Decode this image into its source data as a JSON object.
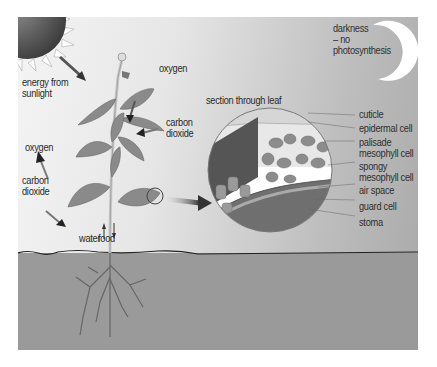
{
  "diagram": {
    "labels": {
      "energy": "energy from\nsunlight",
      "oxygen_top": "oxygen",
      "oxygen_left": "oxygen",
      "co2_left": "carbon\ndioxide",
      "co2_right": "carbon\ndioxide",
      "water": "water",
      "food": "food",
      "section": "section through leaf",
      "darkness": "darkness\n– no\nphotosynthesis"
    },
    "leaf_section_labels": [
      "cuticle",
      "epidermal cell",
      "palisade\nmesophyll cell",
      "spongy\nmesophyll cell",
      "air space",
      "guard cell",
      "stoma"
    ],
    "icons": [
      "sun-icon",
      "moon-icon",
      "plant-illustration",
      "leaf-section-magnifier",
      "arrow-icon"
    ],
    "colors": {
      "sky_light": "#f4f4f4",
      "sky_dark": "#a9a9a9",
      "soil": "#9a9a9a",
      "leaf": "#8a8a8a",
      "sun": "#5a5a5a"
    }
  }
}
